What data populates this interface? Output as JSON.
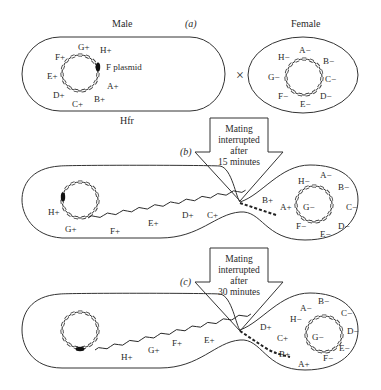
{
  "panel_a": {
    "tag": "(a)",
    "male_label": "Male",
    "female_label": "Female",
    "hfr_label": "Hfr",
    "plasmid_label": "F plasmid",
    "cross_symbol": "×",
    "male_genes": [
      "A+",
      "B+",
      "C+",
      "D+",
      "E+",
      "F+",
      "G+",
      "H+"
    ],
    "female_genes": [
      "A−",
      "B−",
      "C−",
      "D−",
      "E−",
      "F−",
      "G−",
      "H−"
    ]
  },
  "panel_b": {
    "tag": "(b)",
    "arrow_lines": [
      "Mating",
      "interrupted",
      "after",
      "15 minutes"
    ],
    "male_chrom_genes": [
      "H+",
      "G+"
    ],
    "transferring_genes": [
      "F+",
      "E+",
      "D+",
      "C+",
      "B+",
      "A+"
    ],
    "female_genes": [
      "A−",
      "B−",
      "C−",
      "D−",
      "E−",
      "F−",
      "G−",
      "H−"
    ]
  },
  "panel_c": {
    "tag": "(c)",
    "arrow_lines": [
      "Mating",
      "interrupted",
      "after",
      "30 minutes"
    ],
    "transferring_genes": [
      "H+",
      "G+",
      "F+",
      "E+",
      "D+",
      "C+",
      "B+",
      "A+"
    ],
    "female_genes": [
      "A−",
      "B−",
      "C−",
      "D−",
      "E−",
      "F−",
      "G−",
      "H−"
    ]
  }
}
